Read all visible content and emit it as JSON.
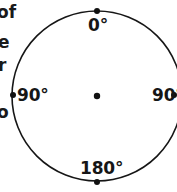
{
  "figure": {
    "background_color": "#ffffff",
    "stroke_color": "#161616",
    "text_color": "#161616"
  },
  "circle": {
    "center_x": 97,
    "center_y": 96,
    "radius": 85,
    "stroke_width": 1.6
  },
  "center_point": {
    "label": "center-dot",
    "x": 97,
    "y": 96,
    "radius": 3.2
  },
  "markers": [
    {
      "name": "marker-top",
      "x": 97,
      "y": 11,
      "radius": 3.0
    },
    {
      "name": "marker-bottom",
      "x": 97,
      "y": 182,
      "radius": 3.0
    },
    {
      "name": "marker-left",
      "x": 13,
      "y": 95,
      "radius": 3.0
    },
    {
      "name": "marker-right",
      "x": 174,
      "y": 95,
      "radius": 3.0
    }
  ],
  "labels": {
    "top": "0°",
    "bottom": "180°",
    "left": "90°",
    "right": "90°"
  },
  "edge_text_fragments": [
    {
      "text": "of"
    },
    {
      "text": "e"
    },
    {
      "text": "r"
    },
    {
      "text": "o"
    }
  ],
  "chart_data": {
    "type": "scatter",
    "title": "",
    "xlabel": "",
    "ylabel": "",
    "categories": [
      "0°",
      "90°",
      "180°",
      "90°"
    ],
    "values": [
      0,
      90,
      180,
      90
    ],
    "series": [
      {
        "name": "bearing-marks",
        "points": [
          {
            "angle_deg": 0,
            "label": "0°",
            "position": "top"
          },
          {
            "angle_deg": 90,
            "label": "90°",
            "position": "right"
          },
          {
            "angle_deg": 180,
            "label": "180°",
            "position": "bottom"
          },
          {
            "angle_deg": 270,
            "label": "90°",
            "position": "left"
          }
        ]
      }
    ],
    "grid": false,
    "legend": "none"
  }
}
